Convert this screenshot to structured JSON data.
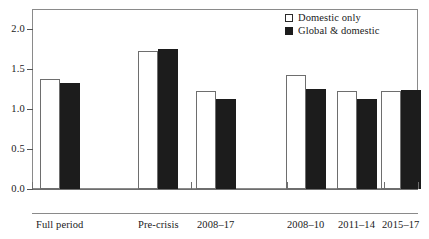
{
  "chart_data": {
    "type": "bar",
    "title": "",
    "xlabel": "",
    "ylabel": "",
    "ylim": [
      0.0,
      2.25
    ],
    "yticks": [
      "0.0",
      "0.5",
      "1.0",
      "1.5",
      "2.0"
    ],
    "ytick_values": [
      0.0,
      0.5,
      1.0,
      1.5,
      2.0
    ],
    "grid": false,
    "legend_position": "top-right",
    "categories": [
      "Full period",
      "Pre-crisis",
      "2008–17",
      "2008–10",
      "2011–14",
      "2015–17"
    ],
    "series": [
      {
        "name": "Domestic only",
        "color": "#ffffff",
        "values": [
          1.38,
          1.72,
          1.23,
          1.42,
          1.23,
          1.22
        ]
      },
      {
        "name": "Global & domestic",
        "color": "#1c1c1c",
        "values": [
          1.32,
          1.75,
          1.13,
          1.25,
          1.13,
          1.24
        ]
      }
    ]
  },
  "legend": {
    "items": [
      {
        "label": "Domestic only",
        "swatch": "open-square-icon"
      },
      {
        "label": "Global & domestic",
        "swatch": "filled-square-icon"
      }
    ]
  },
  "axes": {
    "y": {
      "ticks": [
        {
          "label": "2.0",
          "value": 2.0
        },
        {
          "label": "1.5",
          "value": 1.5
        },
        {
          "label": "1.0",
          "value": 1.0
        },
        {
          "label": "0.5",
          "value": 0.5
        },
        {
          "label": "0.0",
          "value": 0.0
        }
      ]
    },
    "x": {
      "labels": [
        "Full period",
        "Pre-crisis",
        "2008–17",
        "2008–10",
        "2011–14",
        "2015–17"
      ]
    }
  }
}
